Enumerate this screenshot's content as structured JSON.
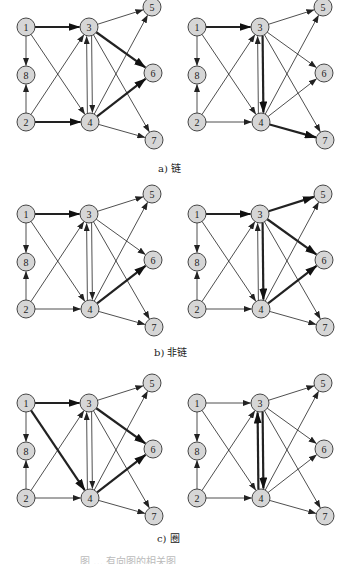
{
  "figure": {
    "nodes": [
      {
        "id": "1",
        "x": 26,
        "y": 27
      },
      {
        "id": "3",
        "x": 89,
        "y": 27
      },
      {
        "id": "5",
        "x": 152,
        "y": 7
      },
      {
        "id": "8",
        "x": 26,
        "y": 75
      },
      {
        "id": "6",
        "x": 153,
        "y": 73
      },
      {
        "id": "2",
        "x": 26,
        "y": 122
      },
      {
        "id": "4",
        "x": 90,
        "y": 122
      },
      {
        "id": "7",
        "x": 154,
        "y": 140
      }
    ],
    "edges": [
      {
        "from": "1",
        "to": "3"
      },
      {
        "from": "1",
        "to": "8"
      },
      {
        "from": "1",
        "to": "4"
      },
      {
        "from": "2",
        "to": "8"
      },
      {
        "from": "2",
        "to": "3"
      },
      {
        "from": "2",
        "to": "4"
      },
      {
        "from": "3",
        "to": "4",
        "offset": -2.5
      },
      {
        "from": "4",
        "to": "3",
        "offset": -2.5
      },
      {
        "from": "3",
        "to": "5"
      },
      {
        "from": "3",
        "to": "6"
      },
      {
        "from": "3",
        "to": "7"
      },
      {
        "from": "4",
        "to": "5"
      },
      {
        "from": "4",
        "to": "6"
      },
      {
        "from": "4",
        "to": "7"
      }
    ],
    "panels": [
      {
        "id": "a-left",
        "dx": 0,
        "dy": 0,
        "bold": [
          "1-3",
          "2-4",
          "3-6",
          "4-6"
        ]
      },
      {
        "id": "a-right",
        "dx": 171,
        "dy": 0,
        "bold": [
          "1-3",
          "3-4",
          "4-7"
        ]
      },
      {
        "id": "b-left",
        "dx": 0,
        "dy": 187,
        "bold": [
          "1-3",
          "4-6"
        ]
      },
      {
        "id": "b-right",
        "dx": 171,
        "dy": 187,
        "bold": [
          "1-3",
          "3-5",
          "3-6",
          "3-4",
          "4-6"
        ]
      },
      {
        "id": "c-left",
        "dx": 0,
        "dy": 376,
        "bold": [
          "1-3",
          "1-4",
          "3-6",
          "4-6"
        ]
      },
      {
        "id": "c-right",
        "dx": 171,
        "dy": 376,
        "bold": [
          "3-4",
          "4-3"
        ]
      }
    ],
    "captions": {
      "a": "a) 链",
      "b": "b) 非链",
      "c": "c) 圈"
    },
    "footer_partial": "图 … 有向图的相关图"
  }
}
